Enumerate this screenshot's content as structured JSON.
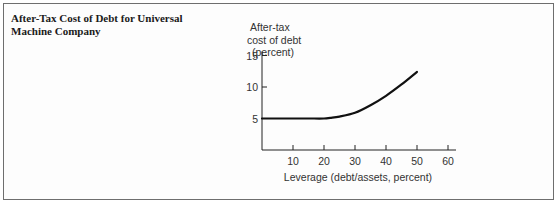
{
  "panel": {
    "title": "After-Tax Cost of Debt for Universal Machine Company"
  },
  "chart_data": {
    "type": "line",
    "title": "After-Tax Cost of Debt for Universal Machine Company",
    "xlabel": "Leverage (debt/assets, percent)",
    "ylabel_lines": [
      "After-tax",
      "cost of debt",
      "(percent)"
    ],
    "xlim": [
      0,
      60
    ],
    "ylim": [
      0,
      15
    ],
    "xticks": [
      10,
      20,
      30,
      40,
      50,
      60
    ],
    "yticks": [
      5,
      10,
      15
    ],
    "grid": false,
    "series": [
      {
        "name": "After-tax cost of debt",
        "x": [
          0,
          5,
          10,
          15,
          20,
          22,
          25,
          30,
          35,
          40,
          45,
          50
        ],
        "y": [
          5,
          5,
          5,
          5,
          5,
          5.1,
          5.3,
          5.9,
          7.1,
          8.6,
          10.4,
          12.4
        ]
      }
    ]
  }
}
